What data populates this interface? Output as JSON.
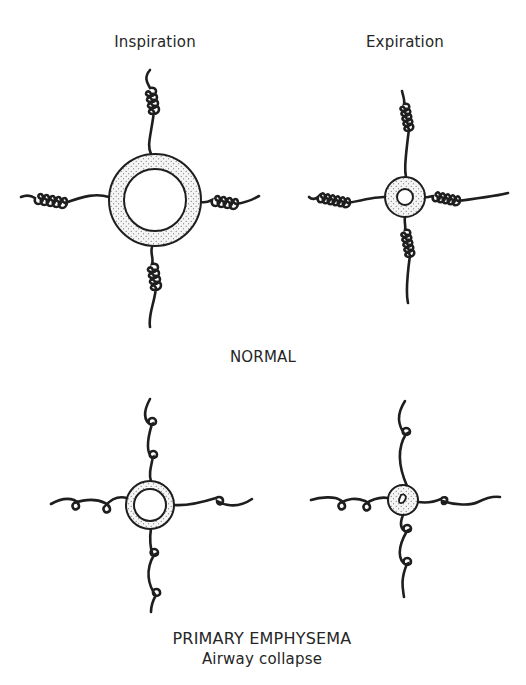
{
  "columns": {
    "inspiration": "Inspiration",
    "expiration": "Expiration"
  },
  "sections": [
    {
      "id": "normal",
      "label": "NORMAL"
    },
    {
      "id": "primary-emphysema",
      "label": "PRIMARY EMPHYSEMA",
      "sublabel": "Airway collapse"
    }
  ],
  "panels": [
    {
      "section": "normal",
      "phase": "inspiration",
      "airway": "large open lumen, thick wall",
      "tethers": "tightly coiled springs"
    },
    {
      "section": "normal",
      "phase": "expiration",
      "airway": "narrowed but patent lumen",
      "tethers": "tightly coiled springs"
    },
    {
      "section": "primary-emphysema",
      "phase": "inspiration",
      "airway": "smaller lumen",
      "tethers": "loose springs with few coils"
    },
    {
      "section": "primary-emphysema",
      "phase": "expiration",
      "airway": "collapsed lumen",
      "tethers": "loose springs with few coils"
    }
  ],
  "colors": {
    "ink": "#1e1e1e",
    "wall_fill": "#f4f4f4",
    "stipple": "#555555",
    "background": "#ffffff"
  }
}
